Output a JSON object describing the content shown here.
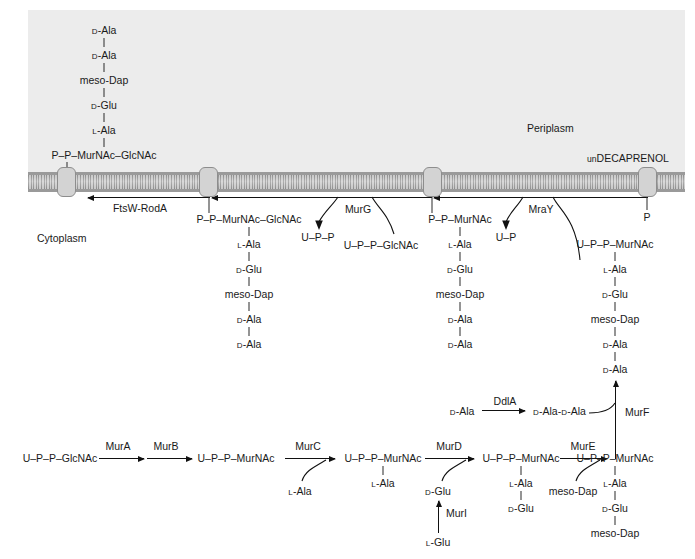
{
  "figure": {
    "regions": {
      "periplasm": "Periplasm",
      "cytoplasm": "Cytoplasm"
    },
    "membrane_carrier": {
      "prefix": "un",
      "main": "DECAPRENOL",
      "full": "unDECAPRENOL"
    },
    "enzymes": {
      "ftsw_roda": "FtsW-RodA",
      "murg": "MurG",
      "mray": "MraY",
      "mura": "MurA",
      "murb": "MurB",
      "murc": "MurC",
      "murd": "MurD",
      "mure": "MurE",
      "murf": "MurF",
      "muri": "MurI",
      "ddla": "DdlA"
    },
    "residues": {
      "d_ala": "D-Ala",
      "l_ala": "L-Ala",
      "d_glu": "D-Glu",
      "l_glu": "L-Glu",
      "meso_dap": "meso-Dap",
      "d_ala_d_ala": "D-Ala-D-Ala"
    },
    "molecules": {
      "pp_murnac_glcnac": "P–P–MurNAc–GlcNAc",
      "pp_murnac": "P–P–MurNAc",
      "upp": "U–P–P",
      "up": "U–P",
      "p": "P",
      "upp_glcnac": "U–P–P–GlcNAc",
      "upp_murnac": "U–P–P–MurNAc"
    },
    "chains": {
      "periplasm_chain": {
        "head": "P–P–MurNAc–GlcNAc",
        "stem": [
          "L-Ala",
          "D-Glu",
          "meso-Dap",
          "D-Ala",
          "D-Ala"
        ]
      },
      "lipid2_chain": {
        "head": "P–P–MurNAc–GlcNAc",
        "stem": [
          "L-Ala",
          "D-Glu",
          "meso-Dap",
          "D-Ala",
          "D-Ala"
        ]
      },
      "lipid1_chain": {
        "head": "P–P–MurNAc",
        "stem": [
          "L-Ala",
          "D-Glu",
          "meso-Dap",
          "D-Ala",
          "D-Ala"
        ]
      },
      "park_nucleotide_chain": {
        "head": "U–P–P–MurNAc",
        "stem": [
          "L-Ala",
          "D-Glu",
          "meso-Dap",
          "D-Ala",
          "D-Ala"
        ]
      },
      "murf_product_chain": {
        "head": "U–P–P–MurNAc",
        "stem": [
          "L-Ala",
          "D-Glu",
          "meso-Dap"
        ]
      },
      "murd_product_chain": {
        "head": "U–P–P–MurNAc",
        "stem": [
          "L-Ala",
          "D-Glu"
        ]
      },
      "murc_product_chain": {
        "head": "U–P–P–MurNAc",
        "stem": [
          "L-Ala"
        ]
      }
    },
    "cytoplasm_row": {
      "start": "U–P–P–GlcNAc",
      "steps": [
        "MurA",
        "MurB",
        "MurC",
        "MurD",
        "MurE"
      ],
      "substrates": [
        "L-Ala",
        "D-Glu",
        "meso-Dap"
      ]
    },
    "branches": {
      "muri_substrate": "L-Glu",
      "muri_product": "D-Glu",
      "ddla_substrate": "D-Ala",
      "ddla_product": "D-Ala-D-Ala"
    }
  }
}
